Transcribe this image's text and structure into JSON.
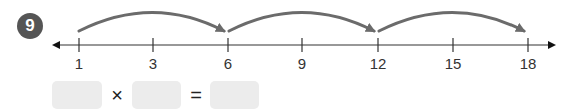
{
  "problem": {
    "number": "9"
  },
  "number_line": {
    "ticks": [
      {
        "label": "1",
        "x": 79
      },
      {
        "label": "3",
        "x": 153
      },
      {
        "label": "6",
        "x": 228
      },
      {
        "label": "9",
        "x": 302
      },
      {
        "label": "12",
        "x": 378
      },
      {
        "label": "15",
        "x": 453
      },
      {
        "label": "18",
        "x": 528
      }
    ],
    "jumps": [
      {
        "from": "1",
        "to": "6"
      },
      {
        "from": "6",
        "to": "12"
      },
      {
        "from": "12",
        "to": "18"
      }
    ]
  },
  "equation": {
    "operator1": "×",
    "operator2": "=",
    "box1": "",
    "box2": "",
    "box3": ""
  },
  "colors": {
    "arc": "#6b6b6b",
    "badge": "#555555",
    "box": "#ececec"
  }
}
